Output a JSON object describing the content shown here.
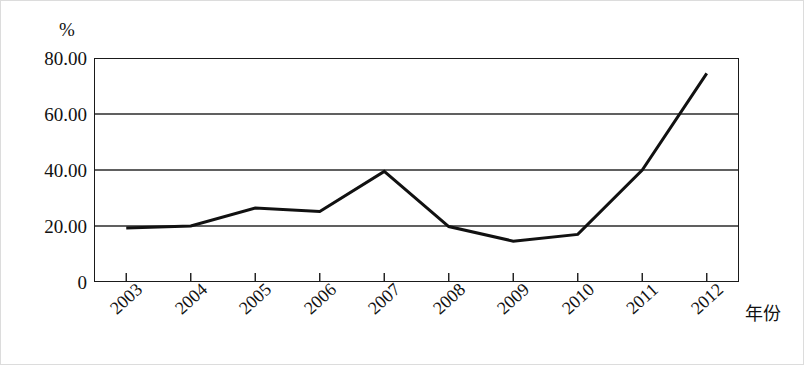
{
  "chart_data": {
    "type": "line",
    "title": "",
    "subtitle": "",
    "xlabel": "年份",
    "ylabel": "",
    "unit_label": "%",
    "categories": [
      "2003",
      "2004",
      "2005",
      "2006",
      "2007",
      "2008",
      "2009",
      "2010",
      "2011",
      "2012"
    ],
    "x": [
      2003,
      2004,
      2005,
      2006,
      2007,
      2008,
      2009,
      2010,
      2011,
      2012
    ],
    "values": [
      19.3,
      20.0,
      26.4,
      25.2,
      39.5,
      19.8,
      14.6,
      17.0,
      40.0,
      74.5
    ],
    "series": [
      {
        "name": "",
        "values": [
          19.3,
          20.0,
          26.4,
          25.2,
          39.5,
          19.8,
          14.6,
          17.0,
          40.0,
          74.5
        ],
        "color": "#111111"
      }
    ],
    "ylim": [
      0,
      80
    ],
    "yticks": [
      0,
      20,
      40,
      60,
      80
    ],
    "ytick_labels": [
      "0",
      "20.00",
      "40.00",
      "60.00",
      "80.00"
    ],
    "xtick_labels": [
      "2003",
      "2004",
      "2005",
      "2006",
      "2007",
      "2008",
      "2009",
      "2010",
      "2011",
      "2012"
    ],
    "grid": "horizontal",
    "legend": "none",
    "line_color": "#111111",
    "line_width": 3,
    "markers": "none",
    "frame_color": "#1a1a1a",
    "gridline_color": "#2b2b2b",
    "background": "#ffffff",
    "xtick_rotation": -42
  }
}
